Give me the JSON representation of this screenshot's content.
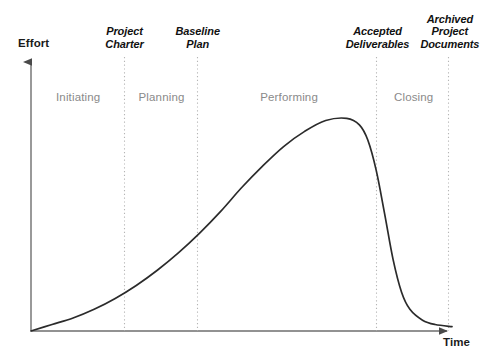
{
  "chart_data": {
    "type": "line",
    "title": "",
    "xlabel": "Time",
    "ylabel": "Effort",
    "grid": false,
    "legend": null,
    "axis_style": "arrow",
    "xlim": [
      0,
      100
    ],
    "ylim": [
      0,
      100
    ],
    "series": [
      {
        "name": "Effort over project life cycle",
        "x": [
          0,
          5,
          10,
          15,
          20,
          25,
          30,
          35,
          40,
          45,
          50,
          55,
          60,
          65,
          70,
          75,
          78,
          80,
          82,
          84,
          86,
          88,
          90,
          93,
          96,
          100
        ],
        "y": [
          0,
          3,
          6,
          10,
          15,
          21,
          28,
          36,
          45,
          55,
          66,
          76,
          85,
          92,
          97,
          98,
          95,
          88,
          74,
          54,
          33,
          18,
          10,
          5,
          3,
          2
        ]
      }
    ],
    "milestones": [
      {
        "id": "project-charter",
        "lines": [
          "Project",
          "Charter"
        ],
        "x_pct": 22.2
      },
      {
        "id": "baseline-plan",
        "lines": [
          "Baseline",
          "Plan"
        ],
        "x_pct": 39.6
      },
      {
        "id": "accepted-deliverables",
        "lines": [
          "Accepted",
          "Deliverables"
        ],
        "x_pct": 82.3
      },
      {
        "id": "archived-project-documents",
        "lines": [
          "Archived",
          "Project",
          "Documents"
        ],
        "x_pct": 99.5
      }
    ],
    "phases": [
      {
        "id": "initiating",
        "label": "Initiating",
        "x_pct": 11.2
      },
      {
        "id": "planning",
        "label": "Planning",
        "x_pct": 31.0
      },
      {
        "id": "performing",
        "label": "Performing",
        "x_pct": 61.3
      },
      {
        "id": "closing",
        "label": "Closing",
        "x_pct": 90.9
      }
    ],
    "colors": {
      "curve": "#2b2b2b",
      "axis": "#6e6e6e",
      "milestone_divider": "#b5b5b5",
      "milestone_text": "#111111",
      "phase_text": "#8a8a8a",
      "background": "#ffffff"
    }
  },
  "geometry": {
    "origin_x": 31,
    "origin_y": 331,
    "x_axis_end": 452,
    "y_axis_top": 57,
    "divider_top": 57
  }
}
